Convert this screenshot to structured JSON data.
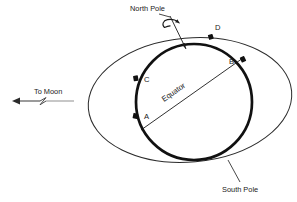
{
  "figure": {
    "title_text": "",
    "labels": {
      "north_pole": "North Pole",
      "south_pole": "South Pole",
      "equator": "Equator",
      "to_moon": "To Moon"
    },
    "points": [
      {
        "id": "A",
        "label": "A",
        "label_x": 144,
        "label_y": 119,
        "dot_x": 136,
        "dot_y": 116
      },
      {
        "id": "B",
        "label": "B",
        "label_x": 231,
        "label_y": 64,
        "dot_x": 243,
        "dot_y": 60
      },
      {
        "id": "C",
        "label": "C",
        "label_x": 144,
        "label_y": 82,
        "dot_x": 136,
        "dot_y": 78
      },
      {
        "id": "D",
        "label": "D",
        "label_x": 215,
        "label_y": 30,
        "dot_x": 211,
        "dot_y": 37
      }
    ],
    "colors": {
      "line": "#111111",
      "thin_line": "#2b2b2b",
      "text": "#1a1a1a",
      "background": "#ffffff",
      "arrow": "#4a4a4a"
    },
    "geometry": {
      "earth_circle": {
        "cx": 194,
        "cy": 102,
        "r": 58,
        "stroke_width": 2.6
      },
      "tidal_ellipse": {
        "cx": 190,
        "cy": 100,
        "rx": 102,
        "ry": 62,
        "rotation_deg": -5,
        "stroke_width": 1.0
      },
      "equator_line": {
        "x1": 141,
        "y1": 130,
        "x2": 243,
        "y2": 58
      },
      "polar_axis": {
        "x1": 171,
        "y1": 18,
        "x2": 183,
        "y2": 46
      },
      "to_moon_arrow": {
        "x_tip": 12,
        "x_tail": 74,
        "y": 101
      }
    },
    "icons": {
      "rotation": "rotation-arrow-icon",
      "moon_direction": "left-arrow-icon",
      "line_break": "zigzag-break-icon"
    }
  }
}
